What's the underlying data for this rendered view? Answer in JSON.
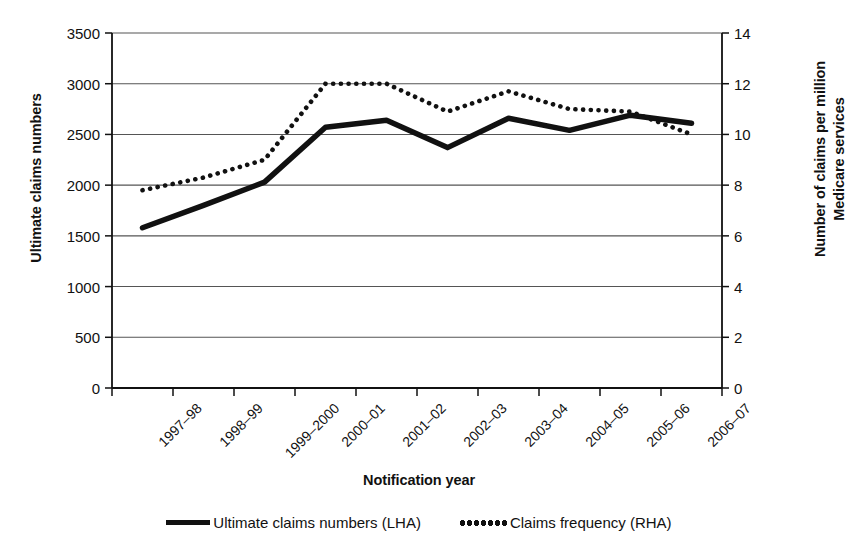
{
  "chart_data": {
    "type": "line",
    "title": "",
    "xlabel": "Notification year",
    "categories": [
      "1997–98",
      "1998–99",
      "1999–2000",
      "2000–01",
      "2001–02",
      "2002–03",
      "2003–04",
      "2004–05",
      "2005–06",
      "2006–07"
    ],
    "grid": true,
    "legend_position": "bottom",
    "axes": {
      "left": {
        "label": "Ultimate claims numbers",
        "ticks": [
          0,
          500,
          1000,
          1500,
          2000,
          2500,
          3000,
          3500
        ],
        "ylim": [
          0,
          3500
        ]
      },
      "right": {
        "label": "Number of claims per million Medicare services",
        "label_line1": "Number of claims per million",
        "label_line2": "Medicare services",
        "ticks": [
          0,
          2,
          4,
          6,
          8,
          10,
          12,
          14
        ],
        "ylim": [
          0,
          14
        ]
      }
    },
    "series": [
      {
        "name": "Ultimate claims numbers (LHA)",
        "axis": "left",
        "style": "solid",
        "color": "#111111",
        "values": [
          1580,
          1800,
          2030,
          2570,
          2640,
          2370,
          2660,
          2540,
          2690,
          2610
        ]
      },
      {
        "name": "Claims frequency (RHA)",
        "axis": "right",
        "style": "dotted",
        "color": "#111111",
        "values": [
          7.8,
          8.3,
          9.0,
          12.0,
          12.0,
          10.9,
          11.7,
          11.0,
          10.9,
          10.0
        ]
      }
    ]
  },
  "legend": {
    "items": [
      {
        "label": "Ultimate claims numbers (LHA)",
        "marker": "solid-line-swatch"
      },
      {
        "label": "Claims frequency (RHA)",
        "marker": "dotted-line-swatch"
      }
    ]
  }
}
